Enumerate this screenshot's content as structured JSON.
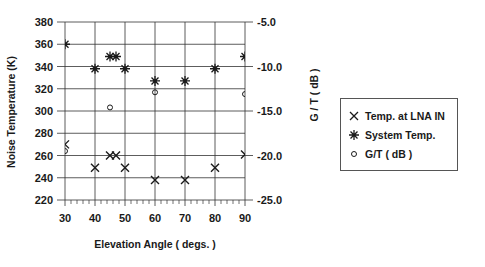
{
  "chart_data": {
    "type": "scatter",
    "title": "",
    "xlabel": "Elevation Angle ( degs. )",
    "ylabel": "Noise Temperature (K)",
    "y2label": "G / T  ( dB )",
    "xlim": [
      30,
      90
    ],
    "ylim": [
      220,
      380
    ],
    "y2lim": [
      -25.0,
      -5.0
    ],
    "x_ticks": [
      30,
      40,
      50,
      60,
      70,
      80,
      90
    ],
    "y_ticks": [
      220,
      240,
      260,
      280,
      300,
      320,
      340,
      360,
      380
    ],
    "y2_ticks": [
      "-25.0",
      "-20.0",
      "-15.0",
      "-10.0",
      "-5.0"
    ],
    "grid": true,
    "legend_position": "right",
    "series": [
      {
        "name": "Temp. at LNA IN",
        "marker": "x",
        "axis": "left",
        "x": [
          30,
          40,
          45,
          47,
          50,
          60,
          70,
          80,
          90
        ],
        "y": [
          270,
          249,
          260,
          260,
          249,
          238,
          238,
          249,
          261
        ]
      },
      {
        "name": "System Temp.",
        "marker": "asterisk",
        "axis": "left",
        "x": [
          30,
          40,
          45,
          47,
          50,
          60,
          70,
          80,
          90
        ],
        "y": [
          360,
          338,
          349,
          349,
          338,
          327,
          327,
          338,
          349
        ]
      },
      {
        "name": "G/T ( dB )",
        "marker": "circle",
        "axis": "right",
        "x": [
          30,
          45,
          60,
          90
        ],
        "y": [
          -19.5,
          -14.6,
          -12.9,
          -13.1
        ]
      }
    ]
  },
  "axes": {
    "xlabel": "Elevation Angle ( degs. )",
    "ylabel": "Noise Temperature (K)",
    "y2label": "G / T  ( dB )"
  },
  "legend": {
    "items": [
      {
        "label": "Temp. at LNA IN",
        "marker": "x"
      },
      {
        "label": "System Temp.",
        "marker": "asterisk"
      },
      {
        "label": "G/T ( dB )",
        "marker": "circle"
      }
    ]
  },
  "colors": {
    "ink": "#1a1a1a",
    "grid": "#333333",
    "background": "#ffffff"
  }
}
